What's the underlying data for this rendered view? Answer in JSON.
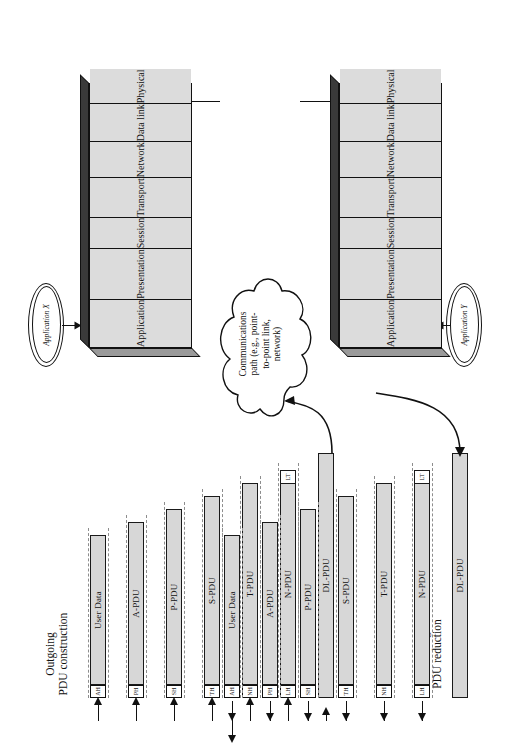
{
  "figure": {
    "left_section": {
      "heading": "Outgoing\nPDU construction",
      "direction": "outgoing"
    },
    "right_section": {
      "heading": "Incoming\nPDU reduction",
      "direction": "incoming"
    }
  },
  "layers": [
    {
      "name": "Application"
    },
    {
      "name": "Presentation"
    },
    {
      "name": "Session"
    },
    {
      "name": "Transport"
    },
    {
      "name": "Network"
    },
    {
      "name": "Data link"
    },
    {
      "name": "Physical"
    }
  ],
  "stacks": [
    {
      "id": "stack-x",
      "application_label": "Application X"
    },
    {
      "id": "stack-y",
      "application_label": "Application Y"
    }
  ],
  "pdus": [
    {
      "label": "User Data",
      "header": "AH",
      "trailer": ""
    },
    {
      "label": "A-PDU",
      "header": "PH",
      "trailer": ""
    },
    {
      "label": "P-PDU",
      "header": "SH",
      "trailer": ""
    },
    {
      "label": "S-PDU",
      "header": "TH",
      "trailer": ""
    },
    {
      "label": "T-PDU",
      "header": "NH",
      "trailer": ""
    },
    {
      "label": "N-PDU",
      "header": "LH",
      "trailer": "LT"
    },
    {
      "label": "DL-PDU",
      "header": "",
      "trailer": ""
    }
  ],
  "cloud": {
    "text": "Communications\npath (e.g., point-\nto-point link,\nnetwork)"
  },
  "colors": {
    "pdu_fill": "#d7d7d7",
    "header_fill": "#ffffff",
    "layer_fill": "#dcdcdc",
    "stack_top": "#3a3a3a",
    "stack_side": "#9a9a9a",
    "stroke": "#111111",
    "dashed": "#8d8d8d"
  }
}
